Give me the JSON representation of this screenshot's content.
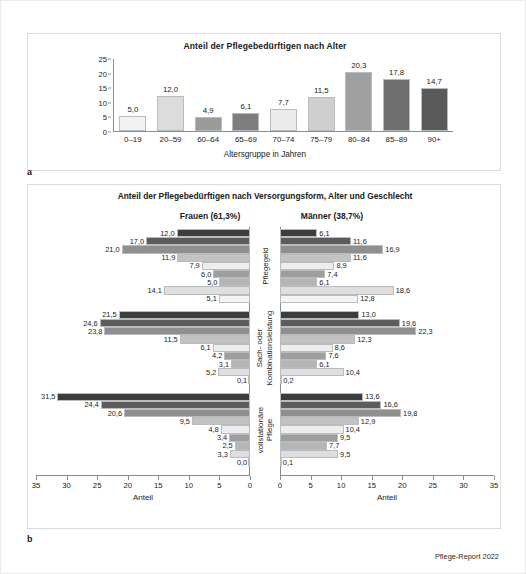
{
  "panel_a": {
    "letter": "a",
    "title": "Anteil der Pflegebedürftigen nach Alter",
    "ylabel": "Anteil",
    "xlabel": "Altersgruppe in Jahren"
  },
  "panel_b": {
    "letter": "b",
    "title": "Anteil der Pflegebedürftigen nach Versorgungsform, Alter und Geschlecht",
    "head_frauen": "Frauen (61,3%)",
    "head_maenner": "Männer (38,7%)",
    "axis_title": "Anteil",
    "group_labels": [
      "Pflegegeld",
      "Sach- oder Kombinationsleistung",
      "vollstationäre Pflege"
    ]
  },
  "footer": "Pflege-Report 2022",
  "chart_data": [
    {
      "type": "bar",
      "panel": "a",
      "title": "Anteil der Pflegebedürftigen nach Alter",
      "xlabel": "Altersgruppe in Jahren",
      "ylabel": "Anteil",
      "ylim": [
        0,
        25
      ],
      "yticks": [
        0,
        5,
        10,
        15,
        20,
        25
      ],
      "grid": false,
      "legend": "none",
      "categories": [
        "0–19",
        "20–59",
        "60–64",
        "65–69",
        "70–74",
        "75–79",
        "80–84",
        "85–89",
        "90+"
      ],
      "values": [
        5.0,
        12.0,
        4.9,
        6.1,
        7.7,
        11.5,
        20.3,
        17.8,
        14.7
      ],
      "value_labels": [
        "5,0",
        "12,0",
        "4,9",
        "6,1",
        "7,7",
        "11,5",
        "20,3",
        "17,8",
        "14,7"
      ],
      "bar_colors": [
        "#f2f2f2",
        "#dcdcdc",
        "#9b9b9b",
        "#7e7e7e",
        "#ebebeb",
        "#cfcfcf",
        "#a0a0a0",
        "#6e6e6e",
        "#5a5a5a"
      ]
    },
    {
      "type": "bar",
      "panel": "b",
      "orientation": "horizontal-diverging",
      "title": "Anteil der Pflegebedürftigen nach Versorgungsform, Alter und Geschlecht",
      "xlabel": "Anteil",
      "xlim": [
        0,
        35
      ],
      "xticks": [
        0,
        5,
        10,
        15,
        20,
        25,
        30,
        35
      ],
      "grid": false,
      "legend": "none",
      "panes": [
        "Frauen (61,3%)",
        "Männer (38,7%)"
      ],
      "groups": [
        {
          "name": "Pflegegeld",
          "categories": [
            "0–19",
            "20–59",
            "60–64",
            "65–69",
            "70–74",
            "75–79",
            "80–84",
            "85–89",
            "90+"
          ],
          "series": [
            {
              "name": "Frauen (61,3%)",
              "values": [
                12.0,
                17.0,
                21.0,
                11.9,
                7.9,
                6.0,
                5.0,
                14.1,
                5.1
              ],
              "value_labels": [
                "12,0",
                "17,0",
                "21,0",
                "11,9",
                "7,9",
                "6,0",
                "5,0",
                "14,1",
                "5,1"
              ]
            },
            {
              "name": "Männer (38,7%)",
              "values": [
                6.1,
                11.6,
                16.9,
                11.6,
                8.9,
                7.4,
                6.1,
                18.6,
                12.8
              ],
              "value_labels": [
                "6,1",
                "11,6",
                "16,9",
                "11,6",
                "8,9",
                "7,4",
                "6,1",
                "18,6",
                "12,8"
              ]
            }
          ]
        },
        {
          "name": "Sach- oder Kombinationsleistung",
          "categories": [
            "0–19",
            "20–59",
            "60–64",
            "65–69",
            "70–74",
            "75–79",
            "80–84",
            "85–89",
            "90+"
          ],
          "series": [
            {
              "name": "Frauen (61,3%)",
              "values": [
                21.5,
                24.6,
                23.8,
                11.5,
                6.1,
                4.2,
                3.1,
                5.2,
                0.1
              ],
              "value_labels": [
                "21,5",
                "24,6",
                "23,8",
                "11,5",
                "6,1",
                "4,2",
                "3,1",
                "5,2",
                "0,1"
              ]
            },
            {
              "name": "Männer (38,7%)",
              "values": [
                13.0,
                19.6,
                22.3,
                12.3,
                8.6,
                7.6,
                6.1,
                10.4,
                0.2
              ],
              "value_labels": [
                "13,0",
                "19,6",
                "22,3",
                "12,3",
                "8,6",
                "7,6",
                "6,1",
                "10,4",
                "0,2"
              ]
            }
          ]
        },
        {
          "name": "vollstationäre Pflege",
          "categories": [
            "0–19",
            "20–59",
            "60–64",
            "65–69",
            "70–74",
            "75–79",
            "80–84",
            "85–89",
            "90+"
          ],
          "series": [
            {
              "name": "Frauen (61,3%)",
              "values": [
                31.5,
                24.4,
                20.6,
                9.5,
                4.8,
                3.4,
                2.5,
                3.3,
                0.0
              ],
              "value_labels": [
                "31,5",
                "24,4",
                "20,6",
                "9,5",
                "4,8",
                "3,4",
                "2,5",
                "3,3",
                "0,0"
              ]
            },
            {
              "name": "Männer (38,7%)",
              "values": [
                13.6,
                16.6,
                19.8,
                12.9,
                10.4,
                9.5,
                7.7,
                9.5,
                0.1
              ],
              "value_labels": [
                "13,6",
                "16,6",
                "19,8",
                "12,9",
                "10,4",
                "9,5",
                "7,7",
                "9,5",
                "0,1"
              ]
            }
          ]
        }
      ],
      "bar_colors": [
        "#3d3d3d",
        "#5c5c5c",
        "#8f8f8f",
        "#c2c2c2",
        "#ededed",
        "#9e9e9e",
        "#b5b5b5",
        "#dedede",
        "#f4f4f4"
      ]
    }
  ]
}
